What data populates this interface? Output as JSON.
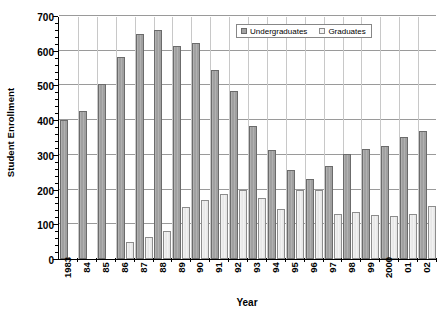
{
  "chart_data": {
    "type": "bar",
    "title": "",
    "xlabel": "Year",
    "ylabel": "Student Enrollment",
    "ylim": [
      0,
      700
    ],
    "ytick_step": 100,
    "yticks": [
      0,
      100,
      200,
      300,
      400,
      500,
      600,
      700
    ],
    "grid": true,
    "legend_position": "top-right-inside",
    "categories": [
      "1983",
      "84",
      "85",
      "86",
      "87",
      "88",
      "89",
      "90",
      "91",
      "92",
      "93",
      "94",
      "95",
      "96",
      "97",
      "98",
      "99",
      "2000",
      "01",
      "02"
    ],
    "series": [
      {
        "name": "Undergraduates",
        "color": "#a3a3a3",
        "values": [
          400,
          425,
          503,
          583,
          648,
          660,
          615,
          622,
          545,
          483,
          382,
          315,
          255,
          230,
          268,
          303,
          318,
          325,
          352,
          370
        ]
      },
      {
        "name": "Graduates",
        "color": "#ececec",
        "values": [
          0,
          0,
          0,
          48,
          63,
          80,
          150,
          170,
          188,
          200,
          175,
          145,
          200,
          200,
          130,
          135,
          128,
          125,
          130,
          152
        ]
      }
    ]
  },
  "axis": {
    "y_title": "Student Enrollment",
    "x_title": "Year"
  },
  "legend": {
    "items": [
      {
        "label": "Undergraduates",
        "swatch": "legend-swatch-undergraduates"
      },
      {
        "label": "Graduates",
        "swatch": "legend-swatch-graduates"
      }
    ]
  }
}
